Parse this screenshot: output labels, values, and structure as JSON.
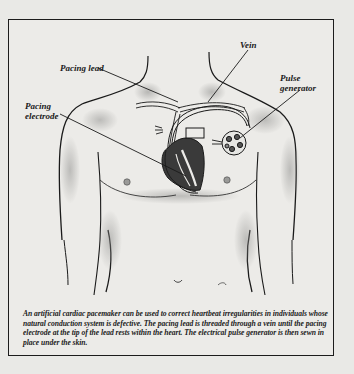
{
  "figure": {
    "labels": {
      "vein": "Vein",
      "pacing_lead": "Pacing lead",
      "pacing_electrode_line1": "Pacing",
      "pacing_electrode_line2": "electrode",
      "pulse_generator_line1": "Pulse",
      "pulse_generator_line2": "generator"
    },
    "caption": "An artificial cardiac pacemaker can be used to correct heartbeat irregularities in individuals whose natural conduction system is defective. The pacing lead is threaded through a vein until the pacing electrode at the tip of the lead rests within the heart. The electrical pulse generator is then sewn in place under the skin.",
    "colors": {
      "background": "#e9e9e6",
      "ink": "#1a1a1a",
      "heart_fill": "#3a3a3a",
      "shading": "#9a9a98"
    }
  }
}
